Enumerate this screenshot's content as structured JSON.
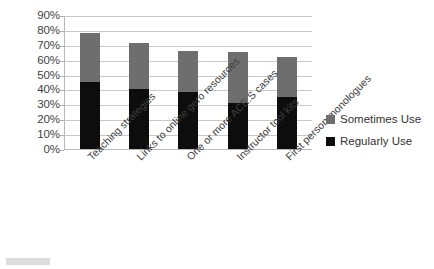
{
  "chart_data": {
    "type": "bar",
    "subtype": "stacked-bar-vertical",
    "title": "",
    "subtitle": "",
    "xlabel": "",
    "ylabel": "",
    "ylim": [
      0,
      90
    ],
    "ytick_step": 10,
    "grid": true,
    "legend_position": "right",
    "categories": [
      "Teaching strategies",
      "Links to online gero resources",
      "One or more ACE.S cases",
      "Instructor tool kits",
      "First person monologues"
    ],
    "ytick_labels": [
      "90%",
      "80%",
      "70%",
      "60%",
      "50%",
      "40%",
      "30%",
      "20%",
      "10%",
      "0%"
    ],
    "ytick_values": [
      90,
      80,
      70,
      60,
      50,
      40,
      30,
      20,
      10,
      0
    ],
    "series": [
      {
        "name": "Regularly Use",
        "color": "#0d0d0d",
        "values": [
          45,
          40,
          38,
          31,
          35
        ]
      },
      {
        "name": "Sometimes Use",
        "color": "#6e6e6e",
        "values": [
          33,
          31,
          28,
          34,
          27
        ]
      }
    ],
    "stack_order_bottom_to_top": [
      "Regularly Use",
      "Sometimes Use"
    ],
    "totals": [
      78,
      71,
      66,
      65,
      62
    ]
  },
  "legend": {
    "items": [
      {
        "label": "Sometimes Use",
        "color": "#6e6e6e"
      },
      {
        "label": "Regularly Use",
        "color": "#0d0d0d"
      }
    ]
  },
  "colors": {
    "regularly_use": "#0d0d0d",
    "sometimes_use": "#6e6e6e",
    "gridline": "#c9c9c9",
    "axis": "#b9b9b9",
    "text": "#3a3a3a",
    "background": "#ffffff"
  }
}
